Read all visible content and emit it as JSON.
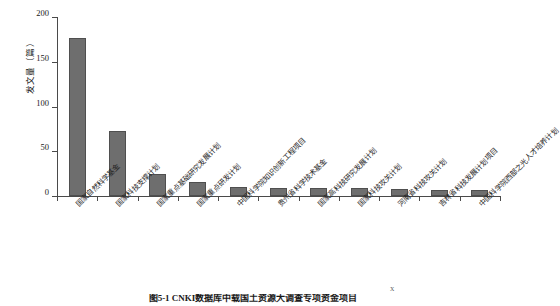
{
  "chart_data": {
    "type": "bar",
    "title": "",
    "xlabel": "",
    "ylabel": "发文量（篇）",
    "ylim": [
      0,
      200
    ],
    "yticks": [
      0,
      50,
      100,
      150,
      200
    ],
    "grid": false,
    "legend": "none",
    "orientation": "vertical",
    "bar_color": "#6e6e6e",
    "categories": [
      "国家自然科学基金",
      "国家科技支撑计划",
      "国家重点基础研究发展计划",
      "国家重点研发计划",
      "中国科学院知识创新工程项目",
      "贵州省科学技术基金",
      "国家高科技研究发展计划",
      "国家科技攻关计划",
      "河南省科技攻关计划",
      "吉林省科技发展计划项目",
      "中国科学院西部之光人才培养计划"
    ],
    "values": [
      177,
      73,
      25,
      16,
      10,
      9,
      9,
      9,
      8,
      7,
      7
    ]
  },
  "axis": {
    "y_title": "发文量（篇）",
    "y_tick_labels": [
      "200",
      "150",
      "100",
      "50",
      "0"
    ]
  },
  "caption": {
    "text": "图5-1 CNKI数据库中载国土资源大调查专项资金项目",
    "superscript": "X"
  }
}
